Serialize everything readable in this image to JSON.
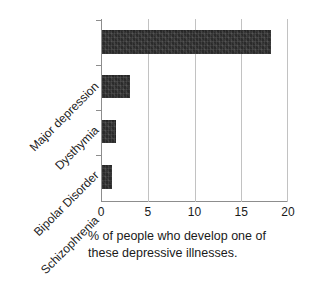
{
  "chart_data": {
    "type": "bar",
    "orientation": "horizontal",
    "title": "",
    "subtitle": "",
    "categories": [
      "Major depression",
      "Dysthymia",
      "Bipolar Disorder",
      "Schizophrenia"
    ],
    "values": [
      18.1,
      3.0,
      1.5,
      1.1
    ],
    "series": [
      {
        "name": "% of people who develop one of these depressive illnesses.",
        "values": [
          18.1,
          3.0,
          1.5,
          1.1
        ]
      }
    ],
    "xlabel": "% of people who develop one of these depressive illnesses.",
    "ylabel": "",
    "xlim": [
      0,
      20
    ],
    "xticks": [
      0,
      5,
      10,
      15,
      20
    ],
    "xtick_labels": [
      "0",
      "5",
      "10",
      "15",
      "20"
    ],
    "grid": true,
    "grid_axis": "x",
    "legend": false,
    "bar_color": "#2b2b2b",
    "axis_color": "#8d8d8d",
    "grid_color": "#c2c2c2",
    "background_color": "#ffffff"
  },
  "caption": {
    "line1": "% of people who develop one of",
    "line2": "these depressive illnesses."
  },
  "axis": {
    "x_tick_0": "0",
    "x_tick_1": "5",
    "x_tick_2": "10",
    "x_tick_3": "15",
    "x_tick_4": "20"
  },
  "categories": {
    "c0": "Major depression",
    "c1": "Dysthymia",
    "c2": "Bipolar Disorder",
    "c3": "Schizophrenia"
  }
}
